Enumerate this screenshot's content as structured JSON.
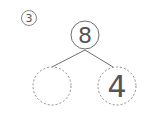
{
  "problem": {
    "number": "3"
  },
  "number_bond": {
    "whole": "8",
    "parts": [
      "",
      "4"
    ]
  },
  "colors": {
    "stroke": "#6e6e6e",
    "dashed_stroke": "#8a8a8a",
    "text": "#555555"
  }
}
